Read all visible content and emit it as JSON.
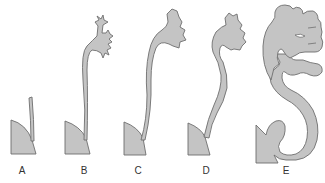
{
  "figure": {
    "fill_color": "#c4c4c4",
    "stroke_color": "#6e6e6e",
    "stages": [
      {
        "label": "A",
        "x": 22
      },
      {
        "label": "B",
        "x": 84
      },
      {
        "label": "C",
        "x": 138
      },
      {
        "label": "D",
        "x": 206
      },
      {
        "label": "E",
        "x": 286
      }
    ]
  }
}
